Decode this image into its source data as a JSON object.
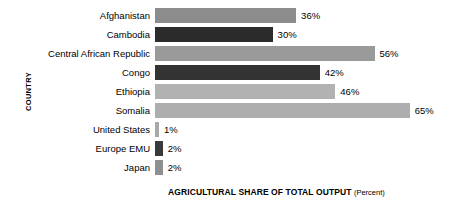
{
  "chart_data": {
    "type": "bar",
    "orientation": "horizontal",
    "title": "",
    "xlabel": "AGRICULTURAL SHARE OF TOTAL OUTPUT",
    "xlabel_unit": "(Percent)",
    "ylabel": "COUNTRY",
    "xlim": [
      0,
      70
    ],
    "grid": false,
    "legend": "none",
    "categories": [
      "Afghanistan",
      "Cambodia",
      "Central African Republic",
      "Congo",
      "Ethiopia",
      "Somalia",
      "United States",
      "Europe EMU",
      "Japan"
    ],
    "values": [
      36,
      30,
      56,
      42,
      46,
      65,
      1,
      2,
      2
    ],
    "value_labels": [
      "36%",
      "30%",
      "56%",
      "42%",
      "46%",
      "65%",
      "1%",
      "2%",
      "2%"
    ],
    "bar_colors": [
      "#8c8c8c",
      "#2b2b2b",
      "#9a9a9a",
      "#333333",
      "#b2b2b2",
      "#aeaeae",
      "#a8a8a8",
      "#3a3a3a",
      "#8f8f8f"
    ]
  },
  "style": {
    "background": "#ffffff",
    "text_color": "#000000"
  }
}
